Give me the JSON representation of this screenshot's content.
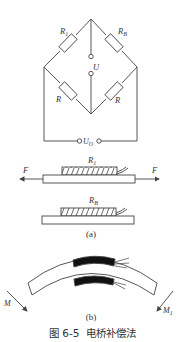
{
  "figure": {
    "caption_number": "图 6-5",
    "caption_title": "电桥补偿法"
  },
  "bridge": {
    "resistors": {
      "top_left": {
        "label": "R",
        "subscript": "1"
      },
      "top_right": {
        "label": "R",
        "subscript": "B"
      },
      "bottom_left": {
        "label": "R",
        "subscript": ""
      },
      "bottom_right": {
        "label": "R",
        "subscript": ""
      }
    },
    "supply_label": "U",
    "output_label": "U",
    "output_subscript": "O"
  },
  "part_a": {
    "label": "(a)",
    "strip1": {
      "gauge_label": "R",
      "gauge_subscript": "1",
      "force_left": "F",
      "force_right": "F"
    },
    "strip2": {
      "gauge_label": "R",
      "gauge_subscript": "B"
    }
  },
  "part_b": {
    "label": "(b)",
    "moment_left": "M",
    "moment_right": "M",
    "moment_right_subscript": "1"
  },
  "colors": {
    "line": "#444444",
    "gauge_fill_b": "#111111",
    "background": "#ffffff"
  }
}
